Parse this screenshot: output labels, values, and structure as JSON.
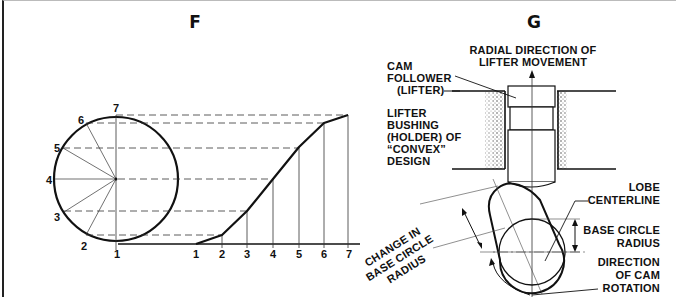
{
  "panels": {
    "f": {
      "title": "F",
      "circle_labels": [
        "1",
        "2",
        "3",
        "4",
        "5",
        "6",
        "7"
      ],
      "axis_labels": [
        "1",
        "2",
        "3",
        "4",
        "5",
        "6",
        "7"
      ]
    },
    "g": {
      "title": "G",
      "labels": {
        "radial_direction_1": "RADIAL DIRECTION OF",
        "radial_direction_2": "LIFTER MOVEMENT",
        "cam_follower_1": "CAM",
        "cam_follower_2": "FOLLOWER",
        "cam_follower_3": "(LIFTER)",
        "bushing_1": "LIFTER",
        "bushing_2": "BUSHING",
        "bushing_3": "(HOLDER) OF",
        "bushing_4": "“CONVEX”",
        "bushing_5": "DESIGN",
        "lobe_1": "LOBE",
        "lobe_2": "CENTERLINE",
        "base_radius_1": "BASE CIRCLE",
        "base_radius_2": "RADIUS",
        "change_1": "CHANGE IN",
        "change_2": "BASE CIRCLE",
        "change_3": "RADIUS",
        "rotation_1": "DIRECTION",
        "rotation_2": "OF CAM",
        "rotation_3": "ROTATION"
      }
    }
  }
}
